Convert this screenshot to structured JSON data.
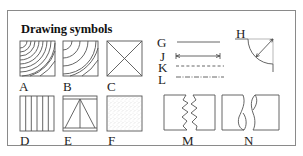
{
  "title": "Drawing symbols",
  "symbols": {
    "A": {
      "label": "A",
      "description": "end grain, quarter-ring arcs (dense)"
    },
    "B": {
      "label": "B",
      "description": "end grain, quarter-ring arcs (sparse)"
    },
    "C": {
      "label": "C",
      "description": "square with diagonal cross"
    },
    "D": {
      "label": "D",
      "description": "square with vertical parallel lines"
    },
    "E": {
      "label": "E",
      "description": "square with triangle and center line"
    },
    "F": {
      "label": "F",
      "description": "stippled square"
    },
    "G": {
      "label": "G",
      "description": "solid line"
    },
    "H": {
      "label": "H",
      "description": "radius with arrow"
    },
    "J": {
      "label": "J",
      "description": "dimension line with arrows"
    },
    "K": {
      "label": "K",
      "description": "dashed line"
    },
    "L": {
      "label": "L",
      "description": "dash-dot center line"
    },
    "M": {
      "label": "M",
      "description": "jagged break line"
    },
    "N": {
      "label": "N",
      "description": "round bar break"
    }
  },
  "colors": {
    "ink": "#555555",
    "frame": "#8a8a8a",
    "background": "#ffffff"
  }
}
